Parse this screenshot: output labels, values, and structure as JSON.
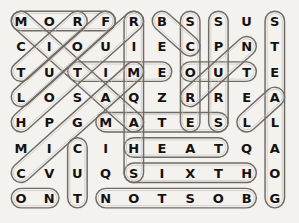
{
  "puzzle": {
    "kind": "word-search-grid",
    "rows": 8,
    "cols": 10,
    "letter_color": "#14110f",
    "oval_color": "#6f6a66",
    "background_color": "#f4f2ef",
    "grid": [
      [
        "M",
        "O",
        "R",
        "F",
        "R",
        "B",
        "S",
        "S",
        "U",
        "S"
      ],
      [
        "C",
        "I",
        "O",
        "U",
        "I",
        "E",
        "C",
        "P",
        "N",
        "T"
      ],
      [
        "T",
        "U",
        "T",
        "I",
        "M",
        "E",
        "O",
        "U",
        "T",
        "E"
      ],
      [
        "L",
        "O",
        "S",
        "A",
        "Q",
        "Z",
        "R",
        "R",
        "E",
        "A"
      ],
      [
        "H",
        "P",
        "G",
        "M",
        "A",
        "T",
        "E",
        "S",
        "L",
        "L"
      ],
      [
        "M",
        "I",
        "C",
        "I",
        "H",
        "E",
        "A",
        "T",
        "Q",
        "A"
      ],
      [
        "C",
        "V",
        "U",
        "Q",
        "S",
        "I",
        "X",
        "T",
        "H",
        "O"
      ],
      [
        "O",
        "N",
        "T",
        "N",
        "O",
        "T",
        "S",
        "O",
        "B",
        "G"
      ]
    ],
    "found_words": [
      {
        "word": "MORF",
        "start_row": 1,
        "start_col": 1,
        "end_row": 1,
        "end_col": 4,
        "direction": "horizontal"
      },
      {
        "word": "TIME",
        "start_row": 3,
        "start_col": 3,
        "end_row": 3,
        "end_col": 6,
        "direction": "horizontal"
      },
      {
        "word": "OUT",
        "start_row": 3,
        "start_col": 7,
        "end_row": 3,
        "end_col": 9,
        "direction": "horizontal"
      },
      {
        "word": "MATES",
        "start_row": 5,
        "start_col": 4,
        "end_row": 5,
        "end_col": 8,
        "direction": "horizontal"
      },
      {
        "word": "HEAT",
        "start_row": 6,
        "start_col": 5,
        "end_row": 6,
        "end_col": 8,
        "direction": "horizontal"
      },
      {
        "word": "SIXTH",
        "start_row": 7,
        "start_col": 5,
        "end_row": 7,
        "end_col": 9,
        "direction": "horizontal"
      },
      {
        "word": "ON",
        "start_row": 8,
        "start_col": 1,
        "end_row": 8,
        "end_col": 2,
        "direction": "horizontal"
      },
      {
        "word": "NOTSOB",
        "start_row": 8,
        "start_col": 4,
        "end_row": 8,
        "end_col": 9,
        "direction": "horizontal"
      },
      {
        "word": "RIMQAHS",
        "start_row": 1,
        "start_col": 5,
        "end_row": 7,
        "end_col": 5,
        "direction": "vertical"
      },
      {
        "word": "SCORES",
        "start_row": 1,
        "start_col": 7,
        "end_row": 5,
        "end_col": 7,
        "direction": "vertical"
      },
      {
        "word": "SPURTS",
        "start_row": 1,
        "start_col": 8,
        "end_row": 5,
        "end_col": 8,
        "direction": "vertical"
      },
      {
        "word": "CUT",
        "start_row": 6,
        "start_col": 3,
        "end_row": 8,
        "end_col": 3,
        "direction": "vertical"
      },
      {
        "word": "STEALAOG",
        "start_row": 1,
        "start_col": 10,
        "end_row": 8,
        "end_col": 10,
        "direction": "vertical"
      },
      {
        "word": "MATCH",
        "start_row": 1,
        "start_col": 1,
        "end_row": 5,
        "end_col": 5,
        "direction": "diagonal-down-right"
      },
      {
        "word": "FOUL",
        "start_row": 1,
        "start_col": 4,
        "end_row": 4,
        "end_col": 1,
        "direction": "diagonal-down-left"
      },
      {
        "word": "CUTS",
        "start_row": 3,
        "start_col": 1,
        "end_row": 1,
        "end_col": 3,
        "direction": "diagonal-up-right"
      },
      {
        "word": "TOSSUP",
        "start_row": 5,
        "start_col": 1,
        "end_row": 1,
        "end_col": 5,
        "direction": "diagonal-up-right"
      },
      {
        "word": "CIGAR",
        "start_row": 7,
        "start_col": 1,
        "end_row": 3,
        "end_col": 5,
        "direction": "diagonal-up-right"
      },
      {
        "word": "BC",
        "start_row": 1,
        "start_col": 6,
        "end_row": 2,
        "end_col": 7,
        "direction": "diagonal-down-right"
      },
      {
        "word": "NUR",
        "start_row": 2,
        "start_col": 9,
        "end_row": 4,
        "end_col": 7,
        "direction": "diagonal-down-left"
      },
      {
        "word": "LA",
        "start_row": 5,
        "start_col": 9,
        "end_row": 4,
        "end_col": 10,
        "direction": "diagonal-up-right"
      }
    ]
  }
}
